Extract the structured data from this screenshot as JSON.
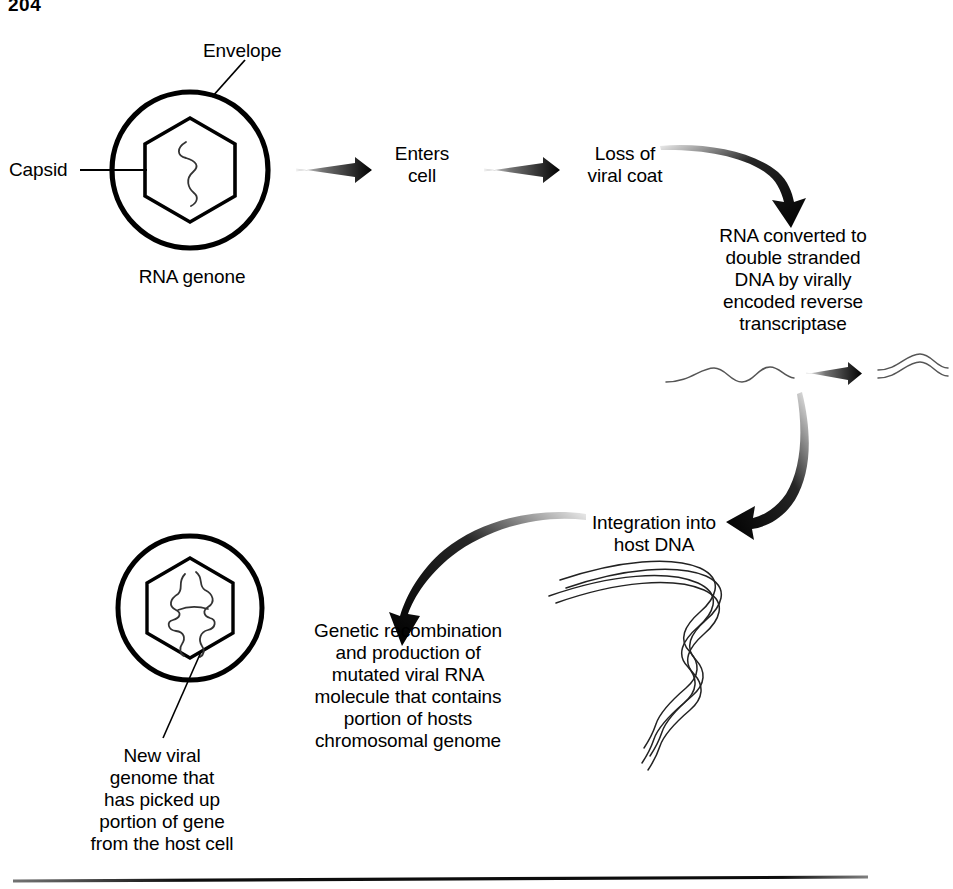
{
  "page": {
    "page_number": "204",
    "width": 953,
    "height": 889,
    "background_color": "#ffffff",
    "ink_color": "#000000"
  },
  "diagram": {
    "type": "process-flow",
    "labels": {
      "envelope": "Envelope",
      "capsid": "Capsid",
      "rna_genome": "RNA genone",
      "enters_cell": "Enters\ncell",
      "loss_of_viral_coat": "Loss of\nviral coat",
      "reverse_transcription": "RNA converted to\ndouble stranded\nDNA by virally\nencoded reverse\ntranscriptase",
      "integration": "Integration into\nhost DNA",
      "recombination": "Genetic recombination\nand production of\nmutated viral RNA\nmolecule that contains\nportion of hosts\nchromosomal genome",
      "new_viral_genome": "New viral\ngenome that\nhas picked up\nportion of gene\nfrom the host cell"
    },
    "steps": [
      {
        "id": "virion-intact",
        "label": "RNA genone"
      },
      {
        "id": "enters-cell",
        "label": "Enters cell"
      },
      {
        "id": "uncoating",
        "label": "Loss of viral coat"
      },
      {
        "id": "reverse-transcription",
        "label": "RNA converted to double stranded DNA by virally encoded reverse transcriptase"
      },
      {
        "id": "integration",
        "label": "Integration into host DNA"
      },
      {
        "id": "recombination",
        "label": "Genetic recombination and production of mutated viral RNA molecule that contains portion of hosts chromosomal genome"
      },
      {
        "id": "new-virion",
        "label": "New viral genome that has picked up portion of gene from the host cell"
      }
    ],
    "shapes": {
      "top_virion": {
        "circle_center": [
          190,
          170
        ],
        "circle_radius": 78,
        "hexagon_radius": 52,
        "contents": "single-stranded-rna-squiggle"
      },
      "bottom_virion": {
        "circle_center": [
          190,
          608
        ],
        "circle_radius": 72,
        "hexagon_radius": 50,
        "contents": "recombinant-rna-branched"
      },
      "ss_rna_strand": {
        "x_range": [
          665,
          855
        ],
        "y": 375,
        "strands": 1
      },
      "ds_dna_strand": {
        "x_range": [
          885,
          953
        ],
        "y": 372,
        "strands": 2
      },
      "host_dna": {
        "strands": 2,
        "shape": "sinuous-chromosome"
      }
    },
    "arrows": [
      {
        "id": "arrow-to-enters-cell",
        "style": "straight-tapered",
        "from": [
          296,
          170
        ],
        "to": [
          362,
          170
        ]
      },
      {
        "id": "arrow-to-loss-of-coat",
        "style": "straight-tapered",
        "from": [
          484,
          170
        ],
        "to": [
          550,
          170
        ]
      },
      {
        "id": "arrow-to-reverse-transcription",
        "style": "curved-tapered",
        "from": [
          660,
          146
        ],
        "to": [
          795,
          214
        ]
      },
      {
        "id": "arrow-rna-to-dna",
        "style": "straight-tapered",
        "from": [
          768,
          372
        ],
        "to": [
          830,
          372
        ]
      },
      {
        "id": "arrow-to-integration",
        "style": "curved-tapered",
        "from": [
          803,
          392
        ],
        "to": [
          742,
          524
        ]
      },
      {
        "id": "arrow-to-recombination",
        "style": "curved-tapered",
        "from": [
          582,
          522
        ],
        "to": [
          406,
          618
        ]
      }
    ],
    "leader_lines": [
      {
        "id": "leader-envelope",
        "from": [
          213,
          96
        ],
        "to": [
          243,
          62
        ]
      },
      {
        "id": "leader-capsid",
        "from": [
          79,
          170
        ],
        "to": [
          148,
          170
        ]
      },
      {
        "id": "leader-new-genome",
        "from": [
          200,
          653
        ],
        "to": [
          163,
          737
        ]
      }
    ],
    "footer_rule": {
      "from": [
        13,
        881
      ],
      "to": [
        868,
        877
      ]
    }
  }
}
